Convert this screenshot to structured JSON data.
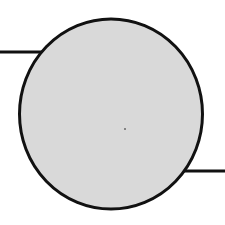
{
  "diagram": {
    "type": "circle-with-leads",
    "circle": {
      "cx": 111,
      "cy": 114,
      "rx": 91.5,
      "ry": 95,
      "fill": "#d9d9d9",
      "stroke": "#111111",
      "stroke_width": 3
    },
    "leads": [
      {
        "name": "left-lead",
        "x1": 0,
        "y1": 52,
        "x2": 42,
        "y2": 52
      },
      {
        "name": "right-lead",
        "x1": 183,
        "y1": 171,
        "x2": 225,
        "y2": 171
      }
    ],
    "lead_stroke": "#111111",
    "lead_stroke_width": 3,
    "center_mark": {
      "cx": 125,
      "cy": 129,
      "r": 1,
      "fill": "#666666"
    }
  }
}
